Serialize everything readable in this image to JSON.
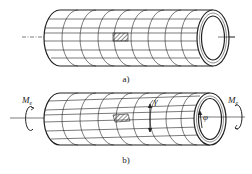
{
  "figure": {
    "panels": [
      {
        "id": "a",
        "caption": "a)",
        "state": "undeformed",
        "description": "Thin-walled tube with surface grid of circumferential and longitudinal lines; hatched element on surface"
      },
      {
        "id": "b",
        "caption": "b)",
        "state": "twisted",
        "description": "Same tube under torque; longitudinal lines inclined by shear angle, end cross-section rotated by twist angle",
        "labels": {
          "torque_left": "M",
          "torque_left_sub": "e",
          "torque_right": "M",
          "torque_right_sub": "e",
          "shear_angle": "γ",
          "twist_angle": "φ"
        }
      }
    ],
    "colors": {
      "line": "#222222",
      "background": "#ffffff"
    }
  }
}
